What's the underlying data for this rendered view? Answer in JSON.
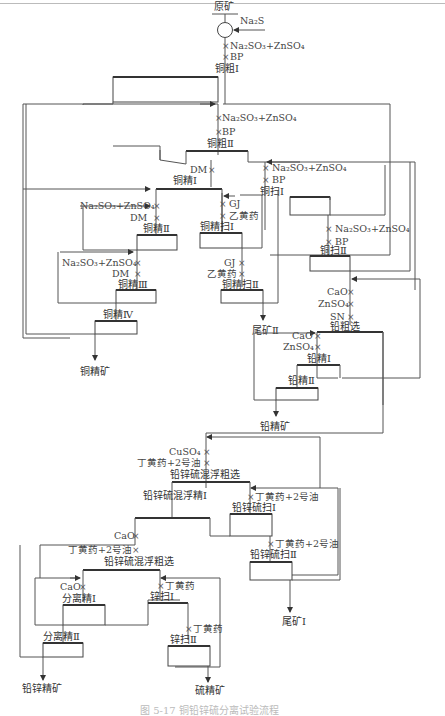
{
  "figure": {
    "caption": "图 5-17 铜铅锌硫分离试验流程",
    "feed": "原矿",
    "feed_reagent": "Na₂S"
  },
  "copper_circuit": {
    "rougher1": {
      "label": "铜粗Ⅰ",
      "reagents": [
        "Na₂SO₃+ZnSO₄",
        "BP"
      ]
    },
    "rougher2": {
      "label": "铜粗Ⅱ",
      "reagents": [
        "Na₂SO₃+ZnSO₄",
        "BP"
      ]
    },
    "scav1": {
      "label": "铜扫Ⅰ",
      "reagents": [
        "Na₂SO₃+ZnSO₄",
        "BP"
      ]
    },
    "scav2": {
      "label": "铜扫Ⅱ",
      "reagents": [
        "Na₂SO₃+ZnSO₄",
        "BP"
      ]
    },
    "cleaner1": {
      "label": "铜精Ⅰ",
      "reagents": [
        "DM"
      ]
    },
    "cleaner2": {
      "label": "铜精Ⅱ",
      "reagents": [
        "Na₂SO₃+ZnSO₄",
        "DM"
      ]
    },
    "cleaner3": {
      "label": "铜精Ⅲ",
      "reagents": [
        "Na₂SO₃+ZnSO₄",
        "DM"
      ]
    },
    "cleaner4": {
      "label": "铜精Ⅳ"
    },
    "cl_scav1": {
      "label": "铜精扫Ⅰ",
      "reagents": [
        "GJ",
        "乙黄药"
      ]
    },
    "cl_scav2": {
      "label": "铜精扫Ⅱ",
      "reagents": [
        "GJ",
        "乙黄药"
      ]
    },
    "product": "铜精矿",
    "tailing": "尾矿Ⅱ"
  },
  "lead_circuit": {
    "rougher": {
      "label": "铅粗选",
      "reagents": [
        "CaO",
        "ZnSO₄",
        "SN"
      ]
    },
    "cleaner1": {
      "label": "铅精Ⅰ",
      "reagents": [
        "CaO",
        "ZnSO₄"
      ]
    },
    "cleaner2": {
      "label": "铅精Ⅱ"
    },
    "product": "铅精矿"
  },
  "bulk_circuit": {
    "rougher": {
      "label": "铅锌硫混浮粗选",
      "reagents": [
        "CuSO₄",
        "丁黄药+2号油"
      ]
    },
    "cleaner1": {
      "label": "铅锌硫混浮精Ⅰ"
    },
    "scav1": {
      "label": "铅锌硫扫Ⅰ",
      "reagents": [
        "丁黄药+2号油"
      ]
    },
    "scav2": {
      "label": "铅锌硫扫Ⅱ",
      "reagents": [
        "丁黄药+2号油"
      ]
    },
    "tailing": "尾矿Ⅰ"
  },
  "separation_circuit": {
    "rougher": {
      "label": "铅锌硫混浮粗选",
      "reagents": [
        "CaO",
        "丁黄药+2号油"
      ]
    },
    "cleaner1": {
      "label": "分离精Ⅰ",
      "reagents": [
        "CaO"
      ]
    },
    "cleaner2": {
      "label": "分离精Ⅱ"
    },
    "scav1": {
      "label": "锌扫Ⅰ",
      "reagents": [
        "丁黄药"
      ]
    },
    "scav2": {
      "label": "锌扫Ⅱ",
      "reagents": [
        "丁黄药"
      ]
    },
    "product_pbzn": "铅锌精矿",
    "product_s": "硫精矿"
  },
  "symbols": {
    "reagent_mark": "×"
  }
}
